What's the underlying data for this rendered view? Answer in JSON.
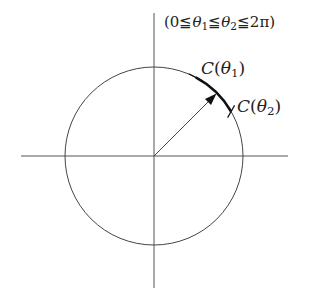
{
  "diagram": {
    "condition_label": "(0≦θ₁≦θ₂≦2π)",
    "condition_parts": {
      "open": "(0",
      "le1": "≦",
      "theta1": "θ",
      "sub1": "1",
      "le2": "≦",
      "theta2": "θ",
      "sub2": "2",
      "le3": "≦",
      "end": "2π)"
    },
    "point1_label": {
      "name": "C",
      "arg_open": "(",
      "theta": "θ",
      "sub": "1",
      "arg_close": ")"
    },
    "point2_label": {
      "name": "C",
      "arg_open": "(",
      "theta": "θ",
      "sub": "2",
      "arg_close": ")"
    },
    "circle": {
      "cx": 154,
      "cy": 156,
      "r": 89
    },
    "theta1_deg": 62,
    "theta2_deg": 30,
    "arrow_deg": 45,
    "colors": {
      "stroke": "#333333",
      "text": "#222222"
    }
  }
}
